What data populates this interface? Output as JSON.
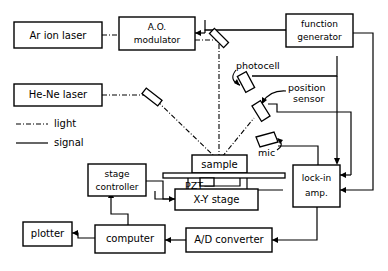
{
  "diagram": {
    "boxes": {
      "ar_ion_laser": "Ar ion laser",
      "ao_modulator_line1": "A.O.",
      "ao_modulator_line2": "modulator",
      "function_generator_line1": "function",
      "function_generator_line2": "generator",
      "he_ne_laser": "He-Ne laser",
      "sample": "sample",
      "xy_stage": "X-Y stage",
      "stage_controller_line1": "stage",
      "stage_controller_line2": "controller",
      "lock_in_amp_line1": "lock-in",
      "lock_in_amp_line2": "amp.",
      "plotter": "plotter",
      "computer": "computer",
      "ad_converter": "A/D converter"
    },
    "labels": {
      "photocell": "photocell",
      "position_sensor_line1": "position",
      "position_sensor_line2": "sensor",
      "mic": "mic",
      "pzt": "PZT"
    },
    "legend": {
      "light": "light",
      "signal": "signal"
    },
    "colors": {
      "stroke": "#000000",
      "background": "#ffffff"
    }
  }
}
